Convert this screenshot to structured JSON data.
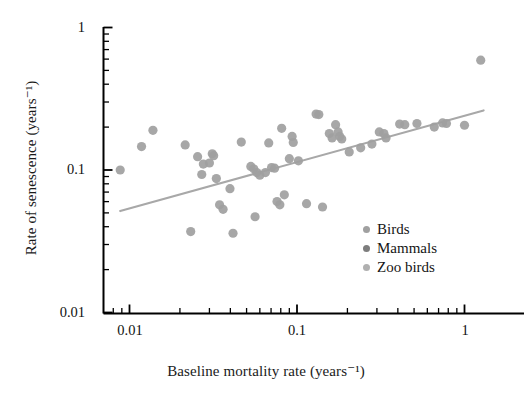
{
  "chart_data": {
    "type": "scatter",
    "title": "",
    "xlabel": "Baseline mortality rate (years⁻¹)",
    "ylabel": "Rate of senescence (years⁻¹)",
    "xscale": "log",
    "yscale": "log",
    "xlim": [
      0.008,
      1.5
    ],
    "ylim": [
      0.01,
      1.0
    ],
    "grid": false,
    "legend_position": "inside-bottom-right",
    "xticks_major": [
      {
        "value": 0.01,
        "label": "0.01"
      },
      {
        "value": 0.1,
        "label": "0.1"
      },
      {
        "value": 1,
        "label": "1"
      }
    ],
    "yticks_major": [
      {
        "value": 0.01,
        "label": "0.01"
      },
      {
        "value": 0.1,
        "label": "0.1"
      },
      {
        "value": 1,
        "label": "1"
      }
    ],
    "legend": [
      {
        "name": "Birds",
        "color": "#a0a0a0"
      },
      {
        "name": "Mammals",
        "color": "#7d7d7d"
      },
      {
        "name": "Zoo birds",
        "color": "#b0b0b0"
      }
    ],
    "series": [
      {
        "name": "Birds",
        "color": "#a0a0a0",
        "points": [
          [
            0.0088,
            0.1
          ],
          [
            0.0138,
            0.19
          ],
          [
            0.0118,
            0.146
          ],
          [
            0.0215,
            0.15
          ],
          [
            0.0232,
            0.037
          ],
          [
            0.0255,
            0.124
          ],
          [
            0.027,
            0.093
          ],
          [
            0.0276,
            0.11
          ],
          [
            0.03,
            0.112
          ],
          [
            0.0312,
            0.13
          ],
          [
            0.0318,
            0.126
          ],
          [
            0.033,
            0.087
          ],
          [
            0.0345,
            0.057
          ],
          [
            0.0362,
            0.053
          ],
          [
            0.0398,
            0.074
          ],
          [
            0.0415,
            0.036
          ],
          [
            0.0465,
            0.157
          ],
          [
            0.053,
            0.106
          ],
          [
            0.0552,
            0.102
          ],
          [
            0.0562,
            0.047
          ],
          [
            0.0575,
            0.096
          ],
          [
            0.06,
            0.092
          ],
          [
            0.0648,
            0.096
          ],
          [
            0.0678,
            0.155
          ],
          [
            0.0705,
            0.104
          ],
          [
            0.0735,
            0.103
          ],
          [
            0.076,
            0.06
          ],
          [
            0.079,
            0.057
          ],
          [
            0.081,
            0.196
          ],
          [
            0.084,
            0.067
          ],
          [
            0.09,
            0.12
          ],
          [
            0.0935,
            0.172
          ],
          [
            0.095,
            0.156
          ],
          [
            0.102,
            0.116
          ],
          [
            0.114,
            0.058
          ],
          [
            0.13,
            0.247
          ],
          [
            0.135,
            0.245
          ],
          [
            0.142,
            0.055
          ],
          [
            0.156,
            0.18
          ],
          [
            0.162,
            0.168
          ],
          [
            0.17,
            0.208
          ],
          [
            0.176,
            0.185
          ],
          [
            0.18,
            0.172
          ],
          [
            0.185,
            0.165
          ],
          [
            0.205,
            0.134
          ],
          [
            0.24,
            0.143
          ],
          [
            0.28,
            0.152
          ],
          [
            0.31,
            0.185
          ],
          [
            0.33,
            0.18
          ],
          [
            0.34,
            0.168
          ],
          [
            0.41,
            0.21
          ],
          [
            0.44,
            0.208
          ],
          [
            0.52,
            0.212
          ],
          [
            0.66,
            0.2
          ],
          [
            0.74,
            0.214
          ],
          [
            0.78,
            0.212
          ],
          [
            1.0,
            0.206
          ],
          [
            1.25,
            0.59
          ]
        ]
      }
    ],
    "trend_line": {
      "name": "regression-line",
      "color": "#a8a8a8",
      "x_start": 0.0088,
      "y_start": 0.0515,
      "x_end": 1.3,
      "y_end": 0.262
    }
  }
}
